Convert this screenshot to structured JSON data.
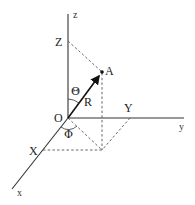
{
  "diagram": {
    "type": "spherical-coordinates",
    "axes": {
      "z": "z",
      "y": "y",
      "x": "x"
    },
    "points": {
      "origin": "O",
      "point": "A",
      "proj_z": "Z",
      "proj_y": "Y",
      "proj_x": "X"
    },
    "vector": {
      "label": "R"
    },
    "angles": {
      "polar": "Θ",
      "azimuth": "Φ"
    },
    "colors": {
      "line": "#333333",
      "vector": "#111111",
      "dashed": "#555555",
      "background": "#ffffff"
    }
  }
}
